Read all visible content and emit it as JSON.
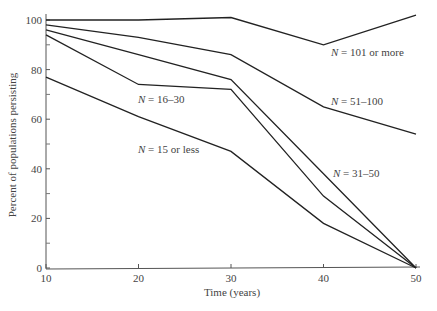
{
  "chart_data": {
    "type": "line",
    "title": "",
    "xlabel": "Time (years)",
    "ylabel": "Percent of populations persisting",
    "x": [
      10,
      20,
      30,
      40,
      50
    ],
    "xticks": [
      "10",
      "20",
      "30",
      "40",
      "50"
    ],
    "yticks": [
      "0",
      "20",
      "40",
      "60",
      "80",
      "100"
    ],
    "xlim": [
      10,
      50
    ],
    "ylim": [
      0,
      100
    ],
    "grid": false,
    "legend": "inline labels",
    "series": [
      {
        "name": "N = 101 or more",
        "values": [
          100,
          100,
          101,
          90,
          102
        ]
      },
      {
        "name": "N = 51–100",
        "values": [
          98,
          93,
          86,
          65,
          54
        ]
      },
      {
        "name": "N = 31–50",
        "values": [
          96,
          86,
          76,
          38,
          0
        ]
      },
      {
        "name": "N = 16–30",
        "values": [
          94,
          74,
          72,
          29,
          0
        ]
      },
      {
        "name": "N = 15 or less",
        "values": [
          77,
          61,
          47,
          18,
          0
        ]
      }
    ]
  },
  "labels": {
    "n101": {
      "italic": "N",
      "rest": " = 101 or more"
    },
    "n51": {
      "italic": "N",
      "rest": " = 51–100"
    },
    "n31": {
      "italic": "N",
      "rest": " = 31–50"
    },
    "n16": {
      "italic": "N",
      "rest": " = 16–30"
    },
    "n15": {
      "italic": "N",
      "rest": " = 15 or less"
    }
  }
}
